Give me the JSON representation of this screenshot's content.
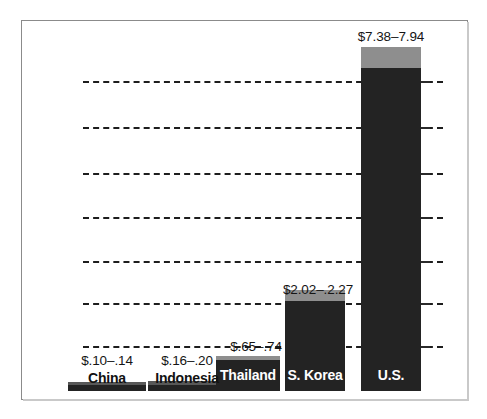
{
  "chart_data": {
    "type": "bar",
    "title": "",
    "subtitle": "",
    "xlabel": "",
    "ylabel": "",
    "categories": [
      "China",
      "Indonesia",
      "Thailand",
      "S. Korea",
      "U.S."
    ],
    "value_labels": [
      "$.10–.14",
      "$.16–.20",
      "$.65–.74",
      "$2.02–.2.27",
      "$7.38–7.94"
    ],
    "low_values": [
      0.1,
      0.16,
      0.65,
      2.02,
      7.38
    ],
    "high_values": [
      0.14,
      0.2,
      0.74,
      2.27,
      7.94
    ],
    "unit": "$",
    "ylim": [
      0,
      8.5
    ],
    "grid": true,
    "gridlines": [
      1,
      2,
      3,
      4,
      5,
      6,
      7
    ],
    "legend": "none",
    "series": [
      {
        "name": "low",
        "values": [
          0.1,
          0.16,
          0.65,
          2.02,
          7.38
        ]
      },
      {
        "name": "high",
        "values": [
          0.14,
          0.2,
          0.74,
          2.27,
          7.94
        ]
      }
    ],
    "colors": {
      "bar_low": "#232323",
      "bar_high_cap": "#8e8e8e",
      "gridline": "#1d1d1d",
      "frame": "#8b8b8b",
      "background": "#ffffff",
      "label_inside": "#ffffff",
      "label_outside": "#111111"
    }
  },
  "bars": [
    {
      "name": "China",
      "value_label": "$.10–.14",
      "label_color": "outside",
      "left": 67,
      "width": 78,
      "body_top": 384,
      "cap_top": 381,
      "bottom": 390,
      "value_label_left": 67,
      "value_label_top": 352,
      "name_label_left": 67,
      "name_label_top": 369
    },
    {
      "name": "Indonesia",
      "value_label": "$.16–.20",
      "label_color": "outside",
      "left": 147,
      "width": 78,
      "body_top": 384,
      "cap_top": 380,
      "bottom": 390,
      "value_label_left": 147,
      "value_label_top": 352,
      "name_label_left": 147,
      "name_label_top": 369
    },
    {
      "name": "Thailand",
      "value_label": "$.65–.74",
      "label_color": "inside",
      "left": 215,
      "width": 64,
      "body_top": 359,
      "cap_top": 355,
      "bottom": 390,
      "value_label_left": 213,
      "value_label_top": 338,
      "name_label_left": 215,
      "name_label_top": 366
    },
    {
      "name": "S. Korea",
      "value_label": "$2.02–.2.27",
      "label_color": "inside",
      "left": 284,
      "width": 60,
      "body_top": 300,
      "cap_top": 289,
      "bottom": 390,
      "value_label_left": 277,
      "value_label_top": 281,
      "name_label_left": 284,
      "name_label_top": 366
    },
    {
      "name": "U.S.",
      "value_label": "$7.38–7.94",
      "label_color": "inside",
      "left": 360,
      "width": 60,
      "body_top": 67,
      "cap_top": 46,
      "bottom": 390,
      "value_label_left": 350,
      "value_label_top": 28,
      "name_label_left": 360,
      "name_label_top": 366
    }
  ],
  "gridlines": [
    {
      "y": 80
    },
    {
      "y": 126
    },
    {
      "y": 172
    },
    {
      "y": 216
    },
    {
      "y": 260
    },
    {
      "y": 302
    },
    {
      "y": 345
    }
  ],
  "gridticks": [
    {
      "y": 80
    },
    {
      "y": 126
    },
    {
      "y": 172
    },
    {
      "y": 216
    },
    {
      "y": 260
    },
    {
      "y": 302
    },
    {
      "y": 345
    }
  ]
}
